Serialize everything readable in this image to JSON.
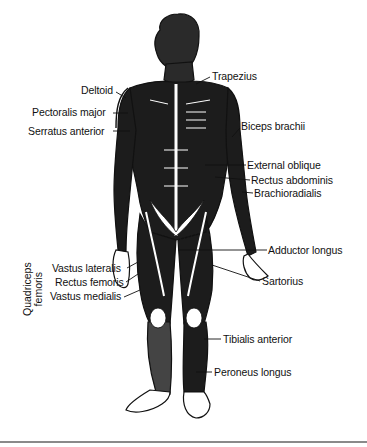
{
  "figure": {
    "type": "anatomical-diagram",
    "labels": {
      "trapezius": "Trapezius",
      "deltoid": "Deltoid",
      "pectoralis_major": "Pectoralis major",
      "serratus_anterior": "Serratus anterior",
      "biceps_brachii": "Biceps brachii",
      "external_oblique": "External oblique",
      "rectus_abdominis": "Rectus abdominis",
      "brachioradialis": "Brachioradialis",
      "adductor_longus": "Adductor longus",
      "sartorius": "Sartorius",
      "vastus_lateralis": "Vastus lateralis",
      "rectus_femoris": "Rectus femoris",
      "vastus_medialis": "Vastus medialis",
      "tibialis_anterior": "Tibialis anterior",
      "peroneus_longus": "Peroneus longus"
    },
    "group_label": {
      "line1": "Quadriceps",
      "line2": "femoris"
    },
    "colors": {
      "ink": "#111111",
      "muscle_dark": "#1a1a1a",
      "paper": "#ffffff",
      "rule": "#8a8a8a"
    }
  }
}
